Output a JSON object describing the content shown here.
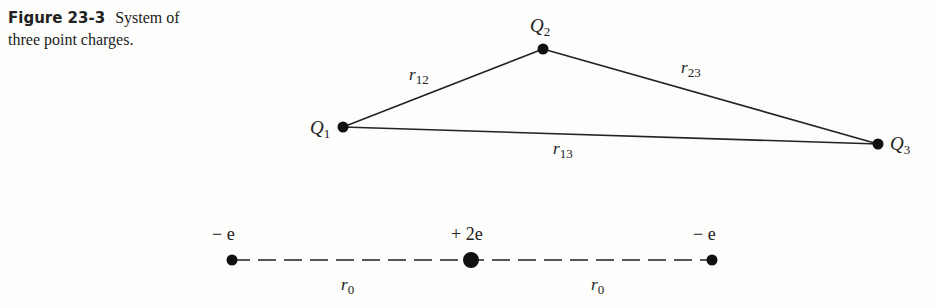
{
  "caption": {
    "figure_label": "Figure 23-3",
    "text": "System of three point charges."
  },
  "triangle": {
    "charges": [
      {
        "name": "Q",
        "sub": "1",
        "x": 343,
        "y": 127
      },
      {
        "name": "Q",
        "sub": "2",
        "x": 543,
        "y": 49
      },
      {
        "name": "Q",
        "sub": "3",
        "x": 878,
        "y": 144
      }
    ],
    "distances": [
      {
        "name": "r",
        "sub": "12"
      },
      {
        "name": "r",
        "sub": "23"
      },
      {
        "name": "r",
        "sub": "13"
      }
    ]
  },
  "line": {
    "charges": [
      {
        "label": "− e",
        "x": 232
      },
      {
        "label": "+ 2e",
        "x": 471
      },
      {
        "label": "− e",
        "x": 712
      }
    ],
    "distances": [
      {
        "name": "r",
        "sub": "0"
      },
      {
        "name": "r",
        "sub": "0"
      }
    ]
  }
}
